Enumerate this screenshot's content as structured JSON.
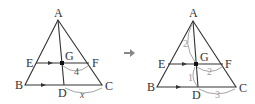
{
  "diagram": {
    "left_figure": {
      "points": {
        "A": "A",
        "B": "B",
        "C": "C",
        "D": "D",
        "E": "E",
        "F": "F",
        "G": "G"
      },
      "segment_labels": {
        "GF": "4",
        "DC": "x"
      }
    },
    "arrow": {
      "icon": "right-arrow-icon"
    },
    "right_figure": {
      "points": {
        "A": "A",
        "B": "B",
        "C": "C",
        "D": "D",
        "E": "E",
        "F": "F",
        "G": "G"
      },
      "segment_labels": {
        "AG": "2",
        "GD": "1",
        "GF": "2",
        "DC": "3"
      }
    },
    "colors": {
      "line": "#333333",
      "annotation": "#9a9a9a",
      "arrow": "#888888"
    }
  }
}
